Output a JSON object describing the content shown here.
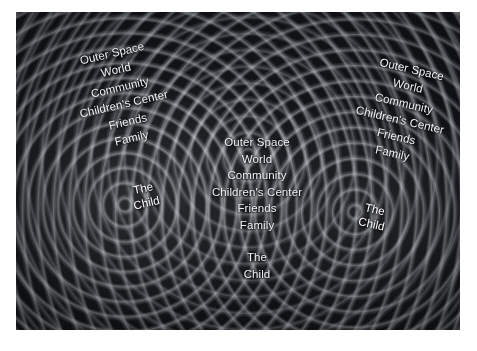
{
  "figure": {
    "background_color": "#14161a",
    "text_color": "#f2f4f6",
    "plate_border_color": "#ffffff"
  },
  "levels": {
    "outer_space": "Outer Space",
    "world": "World",
    "community": "Community",
    "childrens_center": "Children's Center",
    "friends": "Friends",
    "family": "Family",
    "the_child_line1": "The",
    "the_child_line2": "Child",
    "the_child": "The\nChild"
  },
  "blocks": [
    {
      "id": "left",
      "rotation_deg": -13,
      "labels": [
        "Outer Space",
        "World",
        "Community",
        "Children's Center",
        "Friends",
        "Family"
      ],
      "core": "The\nChild"
    },
    {
      "id": "center",
      "rotation_deg": 0,
      "labels": [
        "Outer Space",
        "World",
        "Community",
        "Children's Center",
        "Friends",
        "Family"
      ],
      "core": "The\nChild"
    },
    {
      "id": "right",
      "rotation_deg": 13,
      "labels": [
        "Outer Space",
        "World",
        "Community",
        "Children's Center",
        "Friends",
        "Family"
      ],
      "core": "The\nChild"
    }
  ]
}
